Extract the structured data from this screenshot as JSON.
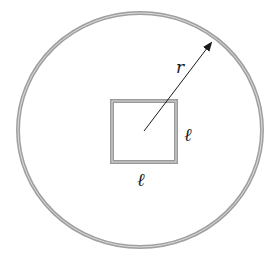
{
  "diagram": {
    "labels": {
      "radius": "r",
      "side_right": "ℓ",
      "side_bottom": "ℓ"
    },
    "colors": {
      "loop_stroke": "#9a9a9a",
      "loop_inner": "#d8d8d8",
      "arrow": "#1a1a1a",
      "background": "#ffffff"
    }
  }
}
